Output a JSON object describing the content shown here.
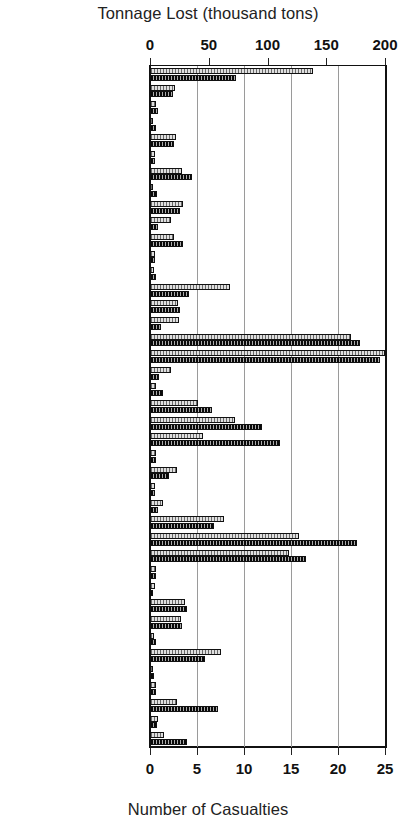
{
  "chart_data": {
    "type": "bar",
    "orientation": "horizontal",
    "title": "",
    "top_axis_label": "Tonnage Lost (thousand tons)",
    "bottom_axis_label": "Number of Casualties",
    "ylabel": "",
    "grid": true,
    "legend": null,
    "top_axis": {
      "label": "Tonnage Lost (thousand tons)",
      "ticks": [
        0,
        50,
        100,
        150,
        200
      ],
      "ticklabels": [
        "0",
        "50",
        "100",
        "150",
        "200"
      ],
      "range": [
        0,
        200
      ]
    },
    "bottom_axis": {
      "label": "Number of Casualties",
      "ticks": [
        0,
        5,
        10,
        15,
        20,
        25
      ],
      "ticklabels": [
        "0",
        "5",
        "10",
        "15",
        "20",
        "25"
      ],
      "range": [
        0,
        25
      ]
    },
    "categories": [
      "Unlisted",
      "Algerian",
      "American",
      "Aremmian",
      "Bahamian",
      "Brazilian",
      "British",
      "Canadian",
      "Cypriot",
      "Danish",
      "Dutch",
      "Ecuadorian",
      "Egyptian",
      "Finnish",
      "French",
      "German",
      "Greek",
      "Honduran",
      "Indian",
      "Indonesian",
      "Italian",
      "Japanese",
      "Liberian",
      "Maldivian",
      "Maltese",
      "Mexican",
      "Netherland Antilles",
      "Norwegian",
      "Panamanian",
      "Philippino",
      "Polish",
      "Portugese",
      "Russian",
      "Spanish",
      "St. Vincent.",
      "Swedish",
      "Thai",
      "Tunisian",
      "Turkish",
      "Vanuatu",
      "Venezuelan"
    ],
    "series": [
      {
        "name": "Tonnage Lost (thousand tons)",
        "axis": "top",
        "units": "thousand tons",
        "values": [
          139,
          21,
          5,
          2,
          22,
          4,
          27,
          2,
          28,
          18,
          20,
          4,
          3,
          68,
          24,
          25,
          171,
          200,
          18,
          5,
          41,
          72,
          45,
          5,
          23,
          4,
          11,
          63,
          127,
          118,
          5,
          4,
          30,
          26,
          3,
          60,
          2,
          5,
          23,
          7,
          12
        ]
      },
      {
        "name": "Number of Casualties",
        "axis": "bottom",
        "units": "casualties",
        "values": [
          9.2,
          2.4,
          0.9,
          0.6,
          2.6,
          0.5,
          4.5,
          0.7,
          3.2,
          0.8,
          3.5,
          0.5,
          0.6,
          4.1,
          3.2,
          1.2,
          22.3,
          24.5,
          1.0,
          1.4,
          6.6,
          11.9,
          13.8,
          0.6,
          2.0,
          0.5,
          0.8,
          6.8,
          22.0,
          16.6,
          0.6,
          0.3,
          3.9,
          3.4,
          0.6,
          5.9,
          0.4,
          0.6,
          7.2,
          0.7,
          3.9
        ]
      }
    ]
  },
  "axis": {
    "top_title": "Tonnage Lost (thousand tons)",
    "bottom_title": "Number of Casualties"
  },
  "style": {
    "tonnage_color": "#b9b9b9",
    "casualties_color": "#3a3a3a",
    "frame_color": "#111111",
    "grid_color": "#9a9a9a"
  }
}
